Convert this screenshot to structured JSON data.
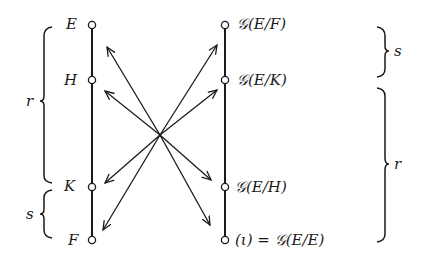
{
  "left_chain": {
    "nodes": [
      {
        "label": "E",
        "y": 25
      },
      {
        "label": "H",
        "y": 80
      },
      {
        "label": "K",
        "y": 187
      },
      {
        "label": "F",
        "y": 240
      }
    ],
    "braces": [
      {
        "label": "r",
        "from": "E",
        "to": "K"
      },
      {
        "label": "s",
        "from": "K",
        "to": "F"
      }
    ]
  },
  "right_chain": {
    "nodes": [
      {
        "label": "𝒢(E/F)",
        "y": 25
      },
      {
        "label": "𝒢(E/K)",
        "y": 80
      },
      {
        "label": "𝒢(E/H)",
        "y": 187
      },
      {
        "label": "(ι) = 𝒢(E/E)",
        "y": 240
      }
    ],
    "braces": [
      {
        "label": "s",
        "from": "𝒢(E/F)",
        "to": "𝒢(E/K)"
      },
      {
        "label": "r",
        "from": "𝒢(E/K)",
        "to": "(ι) = 𝒢(E/E)"
      }
    ]
  },
  "arrows": {
    "count": 8,
    "description": "double-headed correspondence arrows crossing at a central point"
  }
}
